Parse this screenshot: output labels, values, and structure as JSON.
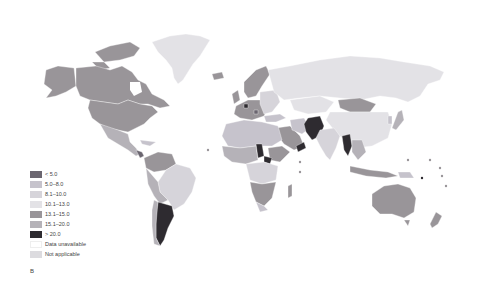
{
  "panel_label": "B",
  "map": {
    "type": "choropleth world map",
    "colors": {
      "lt5": "#6b6670",
      "r5_8": "#c6c3cc",
      "r8_10": "#d6d4da",
      "r10_13": "#e3e2e6",
      "r13_15": "#999599",
      "r15_20": "#b5b2b8",
      "gt20": "#2e2b30",
      "unavailable": "#ffffff",
      "na": "#dcdbdf",
      "ocean": "#ffffff"
    }
  },
  "legend": {
    "items": [
      {
        "label": "< 5.0",
        "color": "#6b6670"
      },
      {
        "label": "5.0–8.0",
        "color": "#c6c3cc"
      },
      {
        "label": "8.1–10.0",
        "color": "#d6d4da"
      },
      {
        "label": "10.1–13.0",
        "color": "#e3e2e6"
      },
      {
        "label": "13.1–15.0",
        "color": "#999599"
      },
      {
        "label": "15.1–20.0",
        "color": "#b5b2b8"
      },
      {
        "label": "> 20.0",
        "color": "#2e2b30"
      },
      {
        "label": "Data unavailable",
        "color": "#ffffff"
      },
      {
        "label": "Not applicable",
        "color": "#dcdbdf"
      }
    ]
  }
}
